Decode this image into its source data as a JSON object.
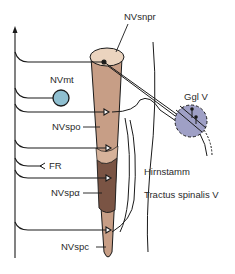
{
  "diagram": {
    "type": "anatomical-schematic",
    "labels": {
      "nvsnpr": "NVsnpr",
      "nvmt": "NVmt",
      "nvspo": "NVspo",
      "fr": "FR",
      "nvspa": "NVspα",
      "nvspc": "NVspc",
      "ggl": "Ggl V",
      "hirnstamm": "Hirnstamm",
      "tractus": "Tractus spinalis V"
    },
    "colors": {
      "column_light": "#ebd4bf",
      "column_mid": "#c79e86",
      "column_dark": "#7a5444",
      "ganglion_fill": "#9fa0c6",
      "nvmt_fill": "#8fbfd0",
      "line": "#1a1a1a"
    }
  }
}
